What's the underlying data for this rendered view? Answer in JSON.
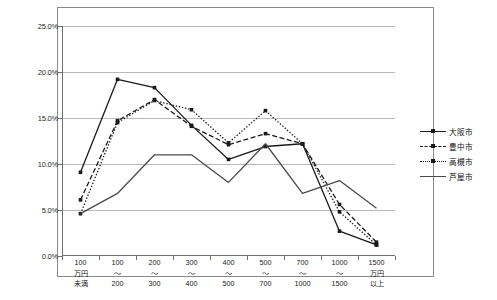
{
  "chart_data": {
    "type": "line",
    "title": "",
    "subtitle": "",
    "xlabel": "",
    "ylabel": "",
    "ylim": [
      0,
      25
    ],
    "ytick_values": [
      0,
      5,
      10,
      15,
      20,
      25
    ],
    "ytick_labels": [
      "0.0%",
      "5.0%",
      "10.0%",
      "15.0%",
      "20.0%",
      "25.0%"
    ],
    "grid": true,
    "legend_position": "right",
    "categories": [
      "100\n万円\n未満",
      "100\n〜\n200",
      "200\n〜\n300",
      "300\n〜\n400",
      "400\n〜\n500",
      "500\n〜\n700",
      "700\n〜\n1000",
      "1000\n〜\n1500",
      "1500\n万円\n以上"
    ],
    "category_labels_flat": [
      "100万円未満",
      "100〜200",
      "200〜300",
      "300〜400",
      "400〜500",
      "500〜700",
      "700〜1000",
      "1000〜1500",
      "1500万円以上"
    ],
    "series": [
      {
        "name": "大阪市",
        "style": "solid",
        "marker": "square",
        "color": "#1a1a1a",
        "values": [
          9.1,
          19.2,
          18.3,
          14.2,
          10.5,
          11.9,
          12.2,
          2.7,
          1.2
        ]
      },
      {
        "name": "豊中市",
        "style": "dashed",
        "marker": "square",
        "color": "#1a1a1a",
        "values": [
          6.1,
          14.7,
          17.0,
          14.1,
          12.1,
          13.3,
          12.2,
          5.6,
          1.5
        ]
      },
      {
        "name": "高槻市",
        "style": "dotted",
        "marker": "square",
        "color": "#1a1a1a",
        "values": [
          4.6,
          14.5,
          16.9,
          15.9,
          12.3,
          15.8,
          12.2,
          4.8,
          1.2
        ]
      },
      {
        "name": "芦屋市",
        "style": "solid",
        "marker": "none",
        "color": "#4a4a4a",
        "values": [
          4.6,
          6.8,
          11.0,
          11.0,
          8.0,
          12.2,
          6.8,
          8.2,
          5.2
        ]
      }
    ]
  },
  "legend": {
    "items": [
      {
        "label": "大阪市"
      },
      {
        "label": "豊中市"
      },
      {
        "label": "高槻市"
      },
      {
        "label": "芦屋市"
      }
    ]
  }
}
